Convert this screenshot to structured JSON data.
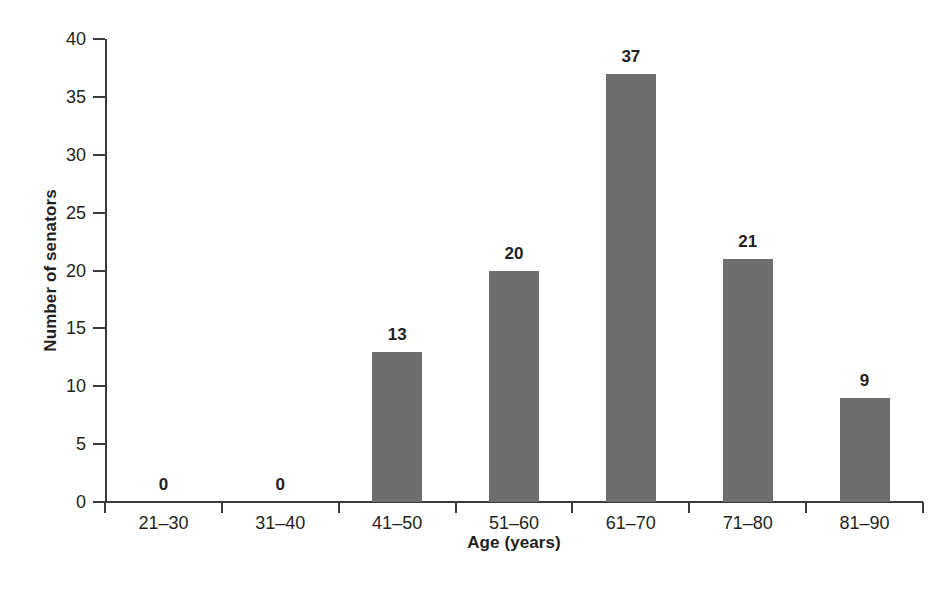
{
  "chart_data": {
    "type": "bar",
    "title": "",
    "xlabel": "Age (years)",
    "ylabel": "Number of senators",
    "categories": [
      "21–30",
      "31–40",
      "41–50",
      "51–60",
      "61–70",
      "71–80",
      "81–90"
    ],
    "values": [
      0,
      0,
      13,
      20,
      37,
      21,
      9
    ],
    "value_labels": [
      "0",
      "0",
      "13",
      "20",
      "37",
      "21",
      "9"
    ],
    "ylim": [
      0,
      40
    ],
    "yticks": [
      0,
      5,
      10,
      15,
      20,
      25,
      30,
      35,
      40
    ],
    "ytick_labels": [
      "0",
      "5",
      "10",
      "15",
      "20",
      "25",
      "30",
      "35",
      "40"
    ],
    "grid": false,
    "legend": null,
    "bar_color": "#6e6e6e",
    "axis_color": "#3b3b3b",
    "text_color": "#231f20",
    "background": "#ffffff"
  }
}
